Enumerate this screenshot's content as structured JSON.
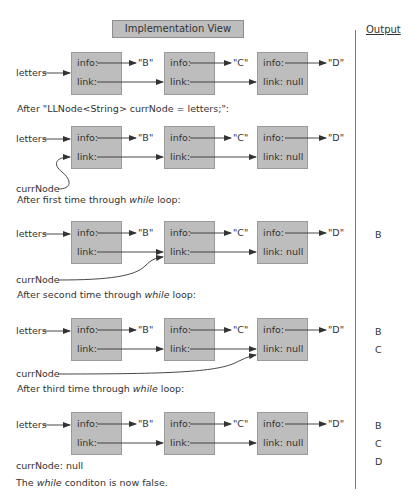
{
  "header": {
    "title": "Implementation View",
    "output_title": "Output"
  },
  "node_values": [
    "\"B\"",
    "\"C\"",
    "\"D\""
  ],
  "labels": {
    "letters": "letters",
    "info": "info:",
    "link": "link:",
    "link_null": "link: null",
    "currNode": "currNode"
  },
  "steps": [
    {
      "caption": "",
      "output": []
    },
    {
      "caption": "After \"LLNode<String> currNode = letters;\":",
      "output": []
    },
    {
      "caption_pre": "After first time through ",
      "caption_em": "while",
      "caption_post": " loop:",
      "output": [
        "B"
      ]
    },
    {
      "caption_pre": "After second time through ",
      "caption_em": "while",
      "caption_post": " loop:",
      "output": [
        "B",
        "C"
      ]
    },
    {
      "caption_pre": "After third time through ",
      "caption_em": "while",
      "caption_post": " loop:",
      "output": [
        "B",
        "C",
        "D"
      ]
    }
  ],
  "footer": {
    "currnode_null": "currNode: null",
    "condition_pre": "The ",
    "condition_em": "while",
    "condition_post": " conditon is now false."
  }
}
